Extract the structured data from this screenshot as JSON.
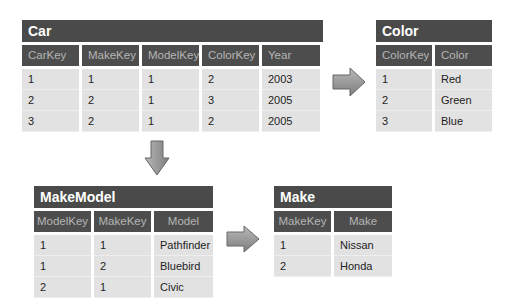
{
  "tables": {
    "car": {
      "title": "Car",
      "headers": [
        "CarKey",
        "MakeKey",
        "ModelKey",
        "ColorKey",
        "Year"
      ],
      "rows": [
        [
          "1",
          "1",
          "1",
          "2",
          "2003"
        ],
        [
          "2",
          "2",
          "1",
          "3",
          "2005"
        ],
        [
          "3",
          "2",
          "1",
          "2",
          "2005"
        ]
      ]
    },
    "color": {
      "title": "Color",
      "headers": [
        "ColorKey",
        "Color"
      ],
      "rows": [
        [
          "1",
          "Red"
        ],
        [
          "2",
          "Green"
        ],
        [
          "3",
          "Blue"
        ]
      ]
    },
    "makemodel": {
      "title": "MakeModel",
      "headers": [
        "ModelKey",
        "MakeKey",
        "Model"
      ],
      "rows": [
        [
          "1",
          "1",
          "Pathfinder"
        ],
        [
          "1",
          "2",
          "Bluebird"
        ],
        [
          "2",
          "1",
          "Civic"
        ]
      ]
    },
    "make": {
      "title": "Make",
      "headers": [
        "MakeKey",
        "Make"
      ],
      "rows": [
        [
          "1",
          "Nissan"
        ],
        [
          "2",
          "Honda"
        ]
      ]
    }
  },
  "arrows": [
    {
      "name": "car-to-color",
      "direction": "right"
    },
    {
      "name": "car-to-makemodel",
      "direction": "down"
    },
    {
      "name": "makemodel-to-make",
      "direction": "right"
    }
  ],
  "colors": {
    "title_bg": "#4a4a4a",
    "header_bg": "#4d4d4d",
    "header_text": "#b5b5b5",
    "cell_bg": "#e2e2e2",
    "arrow_fill": "#8a8a8a"
  }
}
